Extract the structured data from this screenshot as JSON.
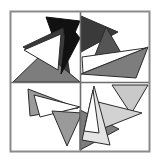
{
  "figure": {
    "type": "abstract-geometric-artwork",
    "canvas": {
      "width": 159,
      "height": 163,
      "background": "#ffffff"
    },
    "frame": {
      "name": "outer-square-border",
      "x": 10.5,
      "y": 11.5,
      "width": 139,
      "height": 140,
      "stroke": "#8a8a8a",
      "stroke_width": 2,
      "fill": "none"
    },
    "divider": {
      "name": "quadrant-cross",
      "vertical_x": 80.5,
      "horizontal_y": 82.5,
      "stroke": "#6e6e6e",
      "stroke_width": 1.6
    },
    "palette": {
      "black": "#111111",
      "dark_gray": "#3a3a3a",
      "mid_dark_gray": "#555555",
      "gray": "#7d7d7d",
      "mid_light_gray": "#9a9a9a",
      "light_gray": "#b8b8b8",
      "pale_gray": "#d2d2d2",
      "very_pale_gray": "#e4e4e4",
      "white": "#ffffff",
      "outline": "#2b2b2b",
      "frame_gray": "#8a8a8a"
    },
    "quadrants": [
      {
        "name": "top-left",
        "tone": "black-and-dark-gray"
      },
      {
        "name": "top-right",
        "tone": "dark-gray"
      },
      {
        "name": "bottom-left",
        "tone": "medium-gray"
      },
      {
        "name": "bottom-right",
        "tone": "light-gray"
      }
    ],
    "shapes": [
      {
        "name": "triangle-tl-black-large",
        "quadrant": "top-left",
        "points": "46,17 80,21 62,62",
        "fill": "#111111",
        "stroke": "#111111"
      },
      {
        "name": "triangle-tl-darkgray-wedge",
        "quadrant": "top-left",
        "points": "23,47 63,28 70,76",
        "fill": "#3a3a3a",
        "stroke": "#2b2b2b"
      },
      {
        "name": "triangle-tl-gray-lower",
        "quadrant": "top-left",
        "points": "13,82 44,52 80,82",
        "fill": "#7d7d7d",
        "stroke": "#2b2b2b"
      },
      {
        "name": "triangle-tl-white-sliver",
        "quadrant": "top-left",
        "points": "24,50 61,34 58,70",
        "fill": "#ffffff",
        "stroke": "#2b2b2b"
      },
      {
        "name": "triangle-tl-black-spike",
        "quadrant": "top-left",
        "points": "67,22 80,38 61,74",
        "fill": "#111111",
        "stroke": "#111111"
      },
      {
        "name": "triangle-tr-darkgray-left",
        "quadrant": "top-right",
        "points": "81,16 81,52 118,32",
        "fill": "#3a3a3a",
        "stroke": "#2b2b2b"
      },
      {
        "name": "triangle-tr-gray-peak",
        "quadrant": "top-right",
        "points": "106,27 92,63 127,63",
        "fill": "#555555",
        "stroke": "#2b2b2b"
      },
      {
        "name": "triangle-tr-gray-band",
        "quadrant": "top-right",
        "points": "148,47 81,74 136,78",
        "fill": "#7d7d7d",
        "stroke": "#2b2b2b"
      },
      {
        "name": "triangle-tr-white-wedge",
        "quadrant": "top-right",
        "points": "82,57 146,48 83,73",
        "fill": "#ffffff",
        "stroke": "#2b2b2b"
      },
      {
        "name": "triangle-bl-lightgray-left",
        "quadrant": "bottom-left",
        "points": "28,89 78,108 30,116",
        "fill": "#9a9a9a",
        "stroke": "#2b2b2b"
      },
      {
        "name": "triangle-bl-white-wedge",
        "quadrant": "bottom-left",
        "points": "34,95 80,107 40,117",
        "fill": "#ffffff",
        "stroke": "#2b2b2b"
      },
      {
        "name": "triangle-bl-gray-down",
        "quadrant": "bottom-left",
        "points": "52,111 82,113 67,146",
        "fill": "#9a9a9a",
        "stroke": "#2b2b2b"
      },
      {
        "name": "triangle-bl-gray-right",
        "quadrant": "bottom-left",
        "points": "80,110 80,150 119,129",
        "fill": "#7d7d7d",
        "stroke": "#2b2b2b"
      },
      {
        "name": "triangle-br-pale-upper",
        "quadrant": "bottom-right",
        "points": "112,85 148,85 131,114",
        "fill": "#c9c9c9",
        "stroke": "#2b2b2b"
      },
      {
        "name": "triangle-br-pale-mid",
        "quadrant": "bottom-right",
        "points": "94,101 142,113 104,128",
        "fill": "#d2d2d2",
        "stroke": "#2b2b2b"
      },
      {
        "name": "triangle-br-pale-tall",
        "quadrant": "bottom-right",
        "points": "94,86 82,140 110,145",
        "fill": "#e4e4e4",
        "stroke": "#2b2b2b"
      },
      {
        "name": "triangle-br-white-inner",
        "quadrant": "bottom-right",
        "points": "93,90 99,133 84,131",
        "fill": "#ffffff",
        "stroke": "#2b2b2b"
      }
    ]
  }
}
